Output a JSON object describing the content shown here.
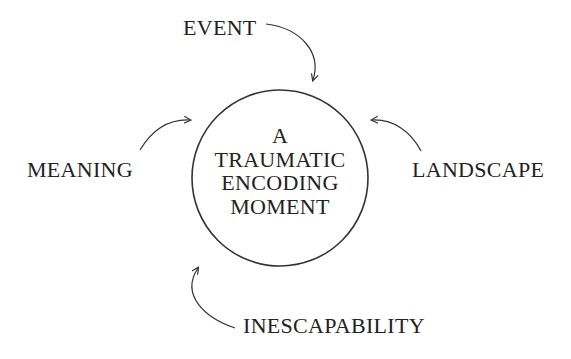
{
  "diagram": {
    "center": {
      "lines": [
        "A",
        "TRAUMATIC",
        "ENCODING",
        "MOMENT"
      ]
    },
    "nodes": {
      "event": "EVENT",
      "meaning": "MEANING",
      "landscape": "LANDSCAPE",
      "inescapability": "INESCAPABILITY"
    },
    "colors": {
      "stroke": "#333333",
      "text": "#222222",
      "background": "#ffffff"
    }
  }
}
